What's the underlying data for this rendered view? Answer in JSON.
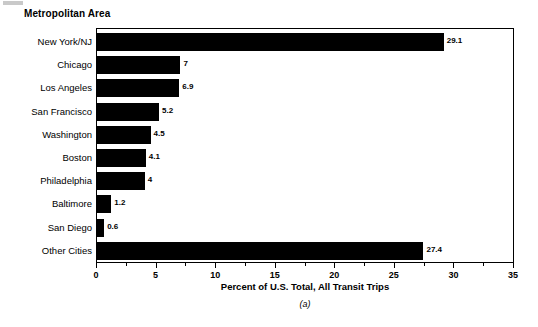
{
  "chart_data": {
    "type": "bar",
    "orientation": "horizontal",
    "title": "Metropolitan Area",
    "xlabel": "Percent of U.S. Total, All Transit Trips",
    "ylabel": "Metropolitan Area",
    "caption": "(a)",
    "categories": [
      "New York/NJ",
      "Chicago",
      "Los Angeles",
      "San Francisco",
      "Washington",
      "Boston",
      "Philadelphia",
      "Baltimore",
      "San Diego",
      "Other Cities"
    ],
    "values": [
      29.1,
      7,
      6.9,
      5.2,
      4.5,
      4.1,
      4,
      1.2,
      0.6,
      27.4
    ],
    "value_labels": [
      "29.1",
      "7",
      "6.9",
      "5.2",
      "4.5",
      "4.1",
      "4",
      "1.2",
      "0.6",
      "27.4"
    ],
    "xlim": [
      0,
      35
    ],
    "xticks": [
      0,
      5,
      10,
      15,
      20,
      25,
      30,
      35
    ],
    "xtick_labels": [
      "0",
      "5",
      "10",
      "15",
      "20",
      "25",
      "30",
      "35"
    ],
    "minor_tick_step": 2.5,
    "grid": false,
    "legend": null,
    "bar_color": "#000000",
    "frame_color": "#000000",
    "background": "#ffffff"
  }
}
